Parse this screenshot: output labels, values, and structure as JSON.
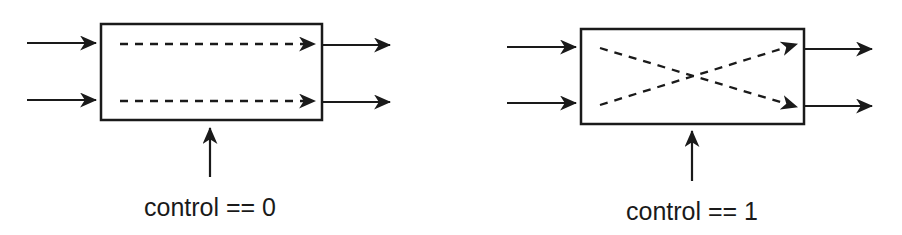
{
  "diagrams": [
    {
      "id": "straight",
      "label": "control == 0",
      "control_value": 0,
      "mode": "pass-through",
      "box": {
        "x": 101,
        "y": 24,
        "w": 221,
        "h": 96
      },
      "inputs": [
        {
          "x1": 27,
          "x2": 96,
          "y": 43
        },
        {
          "x1": 27,
          "x2": 96,
          "y": 100
        }
      ],
      "outputs": [
        {
          "x1": 322,
          "x2": 390,
          "y1": 45,
          "y2": 45
        },
        {
          "x1": 322,
          "x2": 390,
          "y1": 102,
          "y2": 102
        }
      ],
      "internal_paths": [
        {
          "x1": 120,
          "y1": 44,
          "x2": 315,
          "y2": 44
        },
        {
          "x1": 120,
          "y1": 101,
          "x2": 315,
          "y2": 101
        }
      ],
      "control_arrow": {
        "x": 210,
        "y1": 177,
        "y2": 128
      },
      "label_pos": {
        "x": 210,
        "y": 216
      }
    },
    {
      "id": "crossed",
      "label": "control == 1",
      "control_value": 1,
      "mode": "crossover",
      "box": {
        "x": 581,
        "y": 29,
        "w": 223,
        "h": 95
      },
      "inputs": [
        {
          "x1": 507,
          "x2": 576,
          "y": 47
        },
        {
          "x1": 507,
          "x2": 576,
          "y": 103
        }
      ],
      "outputs": [
        {
          "x1": 804,
          "x2": 872,
          "y1": 49,
          "y2": 49
        },
        {
          "x1": 804,
          "x2": 872,
          "y1": 106,
          "y2": 106
        }
      ],
      "internal_paths": [
        {
          "x1": 600,
          "y1": 48,
          "x2": 797,
          "y2": 107
        },
        {
          "x1": 600,
          "y1": 105,
          "x2": 797,
          "y2": 44
        }
      ],
      "control_arrow": {
        "x": 692,
        "y1": 181,
        "y2": 131
      },
      "label_pos": {
        "x": 692,
        "y": 220
      }
    }
  ],
  "colors": {
    "stroke": "#1a1a1a",
    "background": "#ffffff"
  }
}
